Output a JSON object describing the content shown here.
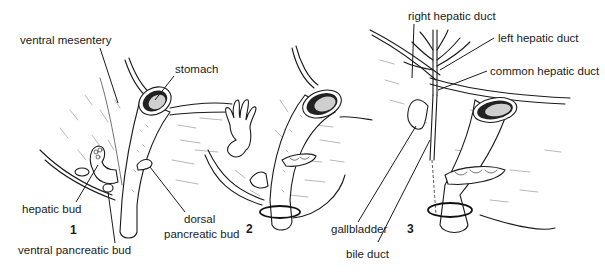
{
  "figure": {
    "panels": [
      {
        "number": "1",
        "labels": {
          "ventral_mesentery": "ventral mesentery",
          "stomach": "stomach",
          "hepatic_bud": "hepatic bud",
          "ventral_pancreatic_bud": "ventral pancreatic bud",
          "dorsal_pancreatic_bud_line1": "dorsal",
          "dorsal_pancreatic_bud_line2": "pancreatic bud"
        }
      },
      {
        "number": "2",
        "labels": {}
      },
      {
        "number": "3",
        "labels": {
          "right_hepatic_duct": "right hepatic duct",
          "left_hepatic_duct": "left hepatic duct",
          "common_hepatic_duct": "common hepatic duct",
          "gallbladder": "gallbladder",
          "bile_duct": "bile duct"
        }
      }
    ]
  }
}
